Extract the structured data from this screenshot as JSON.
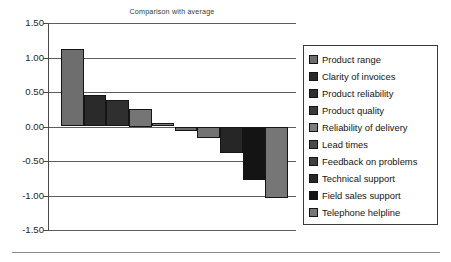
{
  "chart_data": {
    "type": "bar",
    "title": "Comparison with average",
    "xlabel": "",
    "ylabel": "",
    "ylim": [
      -1.5,
      1.5
    ],
    "ytick_labels": [
      "1.50",
      "1.00",
      "0.50",
      "0.00",
      "-0.50",
      "-1.00",
      "-1.50"
    ],
    "ytick_values": [
      1.5,
      1.0,
      0.5,
      0.0,
      -0.5,
      -1.0,
      -1.5
    ],
    "grid": true,
    "legend_position": "right",
    "categories": [
      "Product range",
      "Clarity of invoices",
      "Product reliability",
      "Product quality",
      "Reliability of delivery",
      "Lead times",
      "Feedback on problems",
      "Technical support",
      "Field sales support",
      "Telephone helpline"
    ],
    "values": [
      1.12,
      0.46,
      0.39,
      0.25,
      0.05,
      -0.07,
      -0.16,
      -0.38,
      -0.77,
      -1.04
    ],
    "colors": [
      "#6e6e6e",
      "#2a2a2a",
      "#2f2f2f",
      "#757575",
      "#7d7d7d",
      "#6a6a6a",
      "#737373",
      "#262626",
      "#141414",
      "#767676"
    ]
  },
  "legend": {
    "items": [
      {
        "label": "Product range",
        "color": "#6e6e6e"
      },
      {
        "label": "Clarity of invoices",
        "color": "#2a2a2a"
      },
      {
        "label": "Product reliability",
        "color": "#2f2f2f"
      },
      {
        "label": "Product quality",
        "color": "#3a3a3a"
      },
      {
        "label": "Reliability of delivery",
        "color": "#7d7d7d"
      },
      {
        "label": "Lead times",
        "color": "#4a4a4a"
      },
      {
        "label": "Feedback on problems",
        "color": "#3f3f3f"
      },
      {
        "label": "Technical support",
        "color": "#262626"
      },
      {
        "label": "Field sales support",
        "color": "#141414"
      },
      {
        "label": "Telephone helpline",
        "color": "#767676"
      }
    ]
  }
}
